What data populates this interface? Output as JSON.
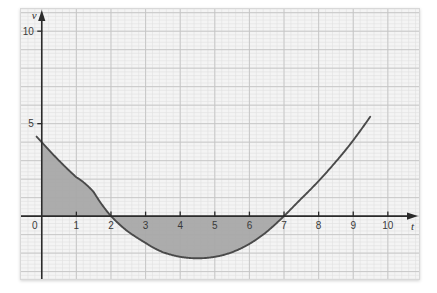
{
  "figure": {
    "background_color": "#ffffff",
    "paper_color": "#f4f4f4",
    "paper_border_color": "#d8d8d8",
    "grid_minor_color": "#e0e0e0",
    "grid_major_color": "#c4c4c4",
    "axis_color": "#2b2b2b",
    "curve_color": "#4a4a4a",
    "shade_color": "#a8a8a8"
  },
  "chart_data": {
    "type": "line",
    "title": "",
    "subtitle": "",
    "xlabel": "t",
    "ylabel": "v",
    "xlim": [
      -0.6,
      10.9
    ],
    "ylim": [
      -3.4,
      11.2
    ],
    "grid": true,
    "grid_minor_step": 0.2,
    "grid_major_step": 1,
    "legend": "none",
    "x_ticks": [
      0,
      1,
      2,
      3,
      4,
      5,
      6,
      7,
      8,
      9,
      10
    ],
    "x_tick_labels": [
      "0",
      "1",
      "2",
      "3",
      "4",
      "5",
      "6",
      "7",
      "8",
      "9",
      "10"
    ],
    "y_ticks": [
      5,
      10
    ],
    "y_tick_labels": [
      "5",
      "10"
    ],
    "origin_label": "0",
    "series": [
      {
        "name": "v(t)",
        "roots": [
          2,
          7
        ],
        "y_intercept": 4.0,
        "vertex": {
          "t": 4.5,
          "v": -2.25
        },
        "value_at_10": 6.8,
        "x": [
          0,
          0.5,
          1,
          1.5,
          2,
          2.5,
          3,
          3.5,
          4,
          4.5,
          5,
          5.5,
          6,
          6.5,
          7,
          7.5,
          8,
          8.5,
          9,
          9.5,
          10
        ],
        "y": [
          4.0,
          3.0,
          2.1,
          1.3,
          0.0,
          -0.85,
          -1.45,
          -1.95,
          -2.2,
          -2.28,
          -2.2,
          -1.95,
          -1.5,
          -0.85,
          0.0,
          0.95,
          1.9,
          2.95,
          4.1,
          5.4,
          6.8
        ]
      }
    ],
    "shaded_regions": [
      {
        "name": "region-above-axis",
        "t_from": 0,
        "t_to": 2,
        "side": "above-axis"
      },
      {
        "name": "region-below-axis",
        "t_from": 2,
        "t_to": 7,
        "side": "below-axis"
      }
    ]
  }
}
